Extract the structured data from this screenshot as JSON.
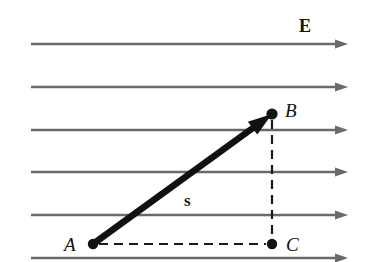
{
  "figure": {
    "width": 370,
    "height": 262,
    "background_color": "#ffffff"
  },
  "colors": {
    "field_line": "#6a6a6a",
    "vector": "#111111",
    "dashed": "#1a1a1a",
    "label": "#121212"
  },
  "field": {
    "label": "E",
    "label_x": 299,
    "label_y": 17,
    "line_color": "#6a6a6a",
    "line_width": 2.4,
    "x_start": 31,
    "x_end": 348,
    "arrow_length": 13,
    "arrow_half_height": 4.6,
    "lines_y": [
      44,
      87,
      130,
      172,
      215,
      258
    ],
    "line_count": 6,
    "direction": "right"
  },
  "points": [
    {
      "id": "A",
      "label": "A",
      "x": 93,
      "y": 244,
      "dot_radius": 5.2,
      "label_x": 64,
      "label_y": 235,
      "label_side": "left"
    },
    {
      "id": "B",
      "label": "B",
      "x": 272,
      "y": 114,
      "dot_radius": 5.6,
      "label_x": 285,
      "label_y": 101,
      "label_side": "right"
    },
    {
      "id": "C",
      "label": "C",
      "x": 272,
      "y": 244,
      "dot_radius": 5.2,
      "label_x": 286,
      "label_y": 235,
      "label_side": "right"
    }
  ],
  "vector": {
    "label": "s",
    "label_x": 184,
    "label_y": 192,
    "from": "A",
    "to": "B",
    "x1": 93,
    "y1": 244,
    "x2": 272,
    "y2": 114,
    "stroke_width": 6.5,
    "arrow_length": 24,
    "arrow_half_height": 8,
    "color": "#111111"
  },
  "dashed_lines": [
    {
      "name": "A-to-C",
      "x1": 99,
      "y1": 244,
      "x2": 266,
      "y2": 244,
      "orientation": "horizontal"
    },
    {
      "name": "B-to-C",
      "x1": 272,
      "y1": 120,
      "x2": 272,
      "y2": 238,
      "orientation": "vertical"
    }
  ],
  "dash_pattern": "9 6",
  "dash_width": 2.2
}
